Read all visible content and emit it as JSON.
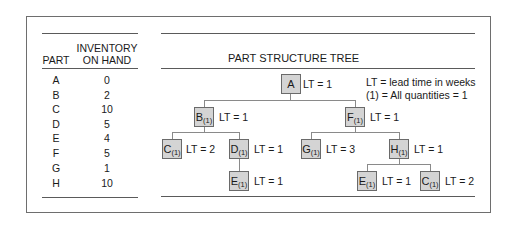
{
  "inventory_table": {
    "headers": {
      "part": "PART",
      "inventory_line1": "INVENTORY",
      "inventory_line2": "ON HAND"
    },
    "rows": [
      {
        "part": "A",
        "on_hand": "0"
      },
      {
        "part": "B",
        "on_hand": "2"
      },
      {
        "part": "C",
        "on_hand": "10"
      },
      {
        "part": "D",
        "on_hand": "5"
      },
      {
        "part": "E",
        "on_hand": "4"
      },
      {
        "part": "F",
        "on_hand": "5"
      },
      {
        "part": "G",
        "on_hand": "1"
      },
      {
        "part": "H",
        "on_hand": "10"
      }
    ]
  },
  "tree": {
    "title": "PART STRUCTURE TREE",
    "legend": {
      "line1": "LT = lead time in weeks",
      "line2": "(1) = All quantities = 1"
    },
    "nodes": {
      "A": {
        "part": "A",
        "qty": "",
        "lt": "LT = 1"
      },
      "B": {
        "part": "B",
        "qty": "(1)",
        "lt": "LT = 1"
      },
      "F": {
        "part": "F",
        "qty": "(1)",
        "lt": "LT = 1"
      },
      "C1": {
        "part": "C",
        "qty": "(1)",
        "lt": "LT = 2"
      },
      "D": {
        "part": "D",
        "qty": "(1)",
        "lt": "LT = 1"
      },
      "E1": {
        "part": "E",
        "qty": "(1)",
        "lt": "LT = 1"
      },
      "G": {
        "part": "G",
        "qty": "(1)",
        "lt": "LT = 3"
      },
      "H": {
        "part": "H",
        "qty": "(1)",
        "lt": "LT = 1"
      },
      "E2": {
        "part": "E",
        "qty": "(1)",
        "lt": "LT = 1"
      },
      "C2": {
        "part": "C",
        "qty": "(1)",
        "lt": "LT = 2"
      }
    }
  },
  "colors": {
    "node_fill": "#d4d4d4",
    "node_border": "#6a6a6a",
    "rule": "#5a5a5a"
  }
}
